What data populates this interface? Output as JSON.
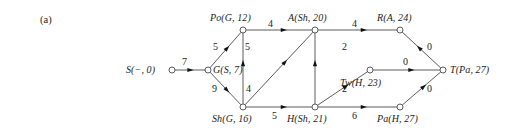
{
  "figure": {
    "panel_label": "(a)",
    "stroke_color": "#4a4a4a",
    "text_color": "#1c1c1c",
    "background": "#ffffff"
  },
  "graph": {
    "type": "directed-weighted-graph",
    "nodes": [
      {
        "id": "S",
        "label": "S(−, 0)",
        "x": 172,
        "y": 70,
        "label_x": 126,
        "label_y": 64,
        "label_align": "right"
      },
      {
        "id": "G",
        "label": "G(S, 7)",
        "x": 208,
        "y": 70,
        "label_x": 213,
        "label_y": 64,
        "label_align": "left"
      },
      {
        "id": "Po",
        "label": "Po(G, 12)",
        "x": 243,
        "y": 30,
        "label_x": 210,
        "label_y": 12,
        "label_align": "left"
      },
      {
        "id": "A",
        "label": "A(Sh, 20)",
        "x": 315,
        "y": 30,
        "label_x": 288,
        "label_y": 12,
        "label_align": "left"
      },
      {
        "id": "R",
        "label": "R(A, 24)",
        "x": 400,
        "y": 30,
        "label_x": 377,
        "label_y": 12,
        "label_align": "left"
      },
      {
        "id": "Sh",
        "label": "Sh(G, 16)",
        "x": 243,
        "y": 107,
        "label_x": 212,
        "label_y": 113,
        "label_align": "left"
      },
      {
        "id": "H",
        "label": "H(Sh, 21)",
        "x": 315,
        "y": 107,
        "label_x": 287,
        "label_y": 113,
        "label_align": "left"
      },
      {
        "id": "Pa",
        "label": "Pa(H, 27)",
        "x": 400,
        "y": 107,
        "label_x": 377,
        "label_y": 113,
        "label_align": "left"
      },
      {
        "id": "Tw",
        "label": "Tw(H, 23)",
        "x": 370,
        "y": 70,
        "label_x": 340,
        "label_y": 77,
        "label_align": "left"
      },
      {
        "id": "T",
        "label": "T(Pa, 27)",
        "x": 443,
        "y": 70,
        "label_x": 450,
        "label_y": 64,
        "label_align": "left"
      }
    ],
    "edges": [
      {
        "from": "S",
        "to": "G",
        "weight": "7",
        "wx": 182,
        "wy": 56
      },
      {
        "from": "G",
        "to": "Po",
        "weight": "5",
        "wx": 213,
        "wy": 41
      },
      {
        "from": "G",
        "to": "Sh",
        "weight": "9",
        "wx": 212,
        "wy": 83
      },
      {
        "from": "Po",
        "to": "A",
        "weight": "4",
        "wx": 268,
        "wy": 18
      },
      {
        "from": "Sh",
        "to": "Po",
        "weight": "5",
        "wx": 245,
        "wy": 41
      },
      {
        "from": "Sh",
        "to": "A",
        "weight": "4",
        "wx": 246,
        "wy": 83
      },
      {
        "from": "Sh",
        "to": "H",
        "weight": "5",
        "wx": 272,
        "wy": 110
      },
      {
        "from": "A",
        "to": "R",
        "weight": "4",
        "wx": 352,
        "wy": 18
      },
      {
        "from": "H",
        "to": "A",
        "weight": "2",
        "wx": 342,
        "wy": 41
      },
      {
        "from": "H",
        "to": "Tw",
        "weight": "2",
        "wx": 342,
        "wy": 83
      },
      {
        "from": "H",
        "to": "Pa",
        "weight": "6",
        "wx": 352,
        "wy": 110
      },
      {
        "from": "Tw",
        "to": "T",
        "weight": "0",
        "wx": 403,
        "wy": 56
      },
      {
        "from": "T",
        "to": "R",
        "weight": "0",
        "wx": 427,
        "wy": 41
      },
      {
        "from": "Pa",
        "to": "T",
        "weight": "0",
        "wx": 427,
        "wy": 83
      }
    ]
  }
}
